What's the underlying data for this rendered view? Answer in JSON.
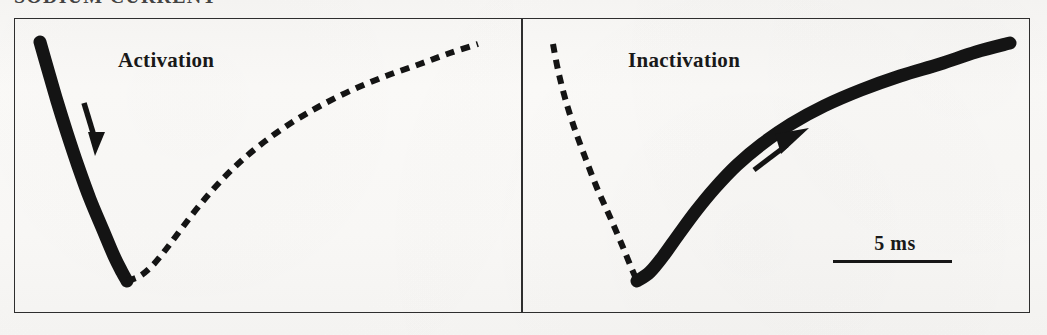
{
  "figure": {
    "title_remnant": "SODIUM  CURRENT",
    "background_color": "#faf9f7",
    "ink_color": "#141414",
    "border_color": "#2e2e2e"
  },
  "panels": [
    {
      "id": "activation",
      "label": "Activation",
      "emphasis": "solid-thick-onset",
      "arrow": {
        "name": "activation-arrow",
        "direction": "down-right"
      }
    },
    {
      "id": "inactivation",
      "label": "Inactivation",
      "emphasis": "solid-thick-decay",
      "arrow": {
        "name": "inactivation-arrow",
        "direction": "up-right"
      }
    }
  ],
  "scalebar": {
    "value": "5",
    "unit": "ms",
    "text": "5  ms",
    "length_px": 119
  },
  "chart_data": {
    "type": "line",
    "title": "SODIUM CURRENT",
    "xlabel": "",
    "ylabel": "",
    "grid": false,
    "legend": "none",
    "y_direction": "inward current plotted downward",
    "x_scale_bar_ms": 5,
    "annotations": [
      {
        "text": "Activation",
        "x_px": 118,
        "y_px": 48
      },
      {
        "text": "Inactivation",
        "x_px": 628,
        "y_px": 48
      },
      {
        "text": "5  ms",
        "x_px": 895,
        "y_px": 243
      }
    ],
    "series": [
      {
        "name": "Activation panel - activation phase (highlighted, thick solid)",
        "panel": "activation",
        "style": "solid",
        "width_px": 13,
        "points": [
          [
            40,
            42
          ],
          [
            48,
            70
          ],
          [
            57,
            101
          ],
          [
            67,
            133
          ],
          [
            78,
            166
          ],
          [
            90,
            199
          ],
          [
            103,
            230
          ],
          [
            114,
            256
          ],
          [
            122,
            272
          ],
          [
            127,
            281
          ]
        ]
      },
      {
        "name": "Activation panel - inactivation phase (de-emphasised, dashed)",
        "panel": "activation",
        "style": "dashed",
        "width_px": 6,
        "points": [
          [
            127,
            281
          ],
          [
            140,
            276
          ],
          [
            153,
            265
          ],
          [
            167,
            248
          ],
          [
            182,
            228
          ],
          [
            199,
            206
          ],
          [
            218,
            184
          ],
          [
            240,
            162
          ],
          [
            264,
            142
          ],
          [
            291,
            123
          ],
          [
            320,
            106
          ],
          [
            352,
            90
          ],
          [
            386,
            76
          ],
          [
            420,
            64
          ],
          [
            450,
            53
          ],
          [
            478,
            44
          ]
        ]
      },
      {
        "name": "Inactivation panel - activation phase (de-emphasised, dashed)",
        "panel": "inactivation",
        "style": "dashed",
        "width_px": 6,
        "points": [
          [
            553,
            44
          ],
          [
            558,
            70
          ],
          [
            565,
            98
          ],
          [
            574,
            127
          ],
          [
            585,
            157
          ],
          [
            597,
            188
          ],
          [
            610,
            217
          ],
          [
            622,
            245
          ],
          [
            631,
            267
          ],
          [
            637,
            281
          ]
        ]
      },
      {
        "name": "Inactivation panel - inactivation phase (highlighted, thick solid)",
        "panel": "inactivation",
        "style": "solid",
        "width_px": 13,
        "points": [
          [
            637,
            281
          ],
          [
            650,
            272
          ],
          [
            664,
            255
          ],
          [
            679,
            234
          ],
          [
            696,
            211
          ],
          [
            715,
            188
          ],
          [
            737,
            165
          ],
          [
            762,
            144
          ],
          [
            791,
            124
          ],
          [
            824,
            106
          ],
          [
            861,
            90
          ],
          [
            900,
            76
          ],
          [
            940,
            64
          ],
          [
            976,
            52
          ],
          [
            1010,
            43
          ]
        ]
      }
    ]
  }
}
